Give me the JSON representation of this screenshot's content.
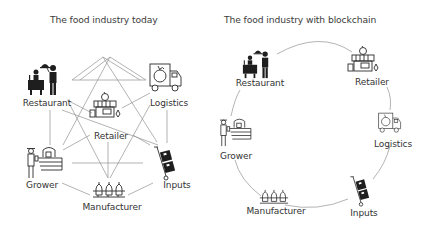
{
  "left_diagram": {
    "title": "The food industry today",
    "topology": "fully-connected mesh",
    "nodes": [
      {
        "id": "restaurant",
        "label": "Restaurant",
        "icon": "restaurant-waiter-icon"
      },
      {
        "id": "logistics",
        "label": "Logistics",
        "icon": "delivery-truck-apple-icon"
      },
      {
        "id": "retailer",
        "label": "Retailer",
        "icon": "storefront-icon"
      },
      {
        "id": "grower",
        "label": "Grower",
        "icon": "farmer-field-icon"
      },
      {
        "id": "inputs",
        "label": "Inputs",
        "icon": "hand-truck-boxes-icon"
      },
      {
        "id": "manufacturer",
        "label": "Manufacturer",
        "icon": "factory-bottles-icon"
      }
    ]
  },
  "right_diagram": {
    "title": "The food industry with blockchain",
    "topology": "ring",
    "nodes": [
      {
        "id": "restaurant",
        "label": "Restaurant",
        "icon": "restaurant-waiter-icon"
      },
      {
        "id": "retailer",
        "label": "Retailer",
        "icon": "storefront-icon"
      },
      {
        "id": "logistics",
        "label": "Logistics",
        "icon": "delivery-truck-apple-icon"
      },
      {
        "id": "inputs",
        "label": "Inputs",
        "icon": "hand-truck-boxes-icon"
      },
      {
        "id": "manufacturer",
        "label": "Manufacturer",
        "icon": "factory-bottles-icon"
      },
      {
        "id": "grower",
        "label": "Grower",
        "icon": "farmer-field-icon"
      }
    ]
  },
  "colors": {
    "line": "#9a9a9a",
    "icon": "#1e1e1e",
    "text": "#333333",
    "background": "#ffffff"
  }
}
